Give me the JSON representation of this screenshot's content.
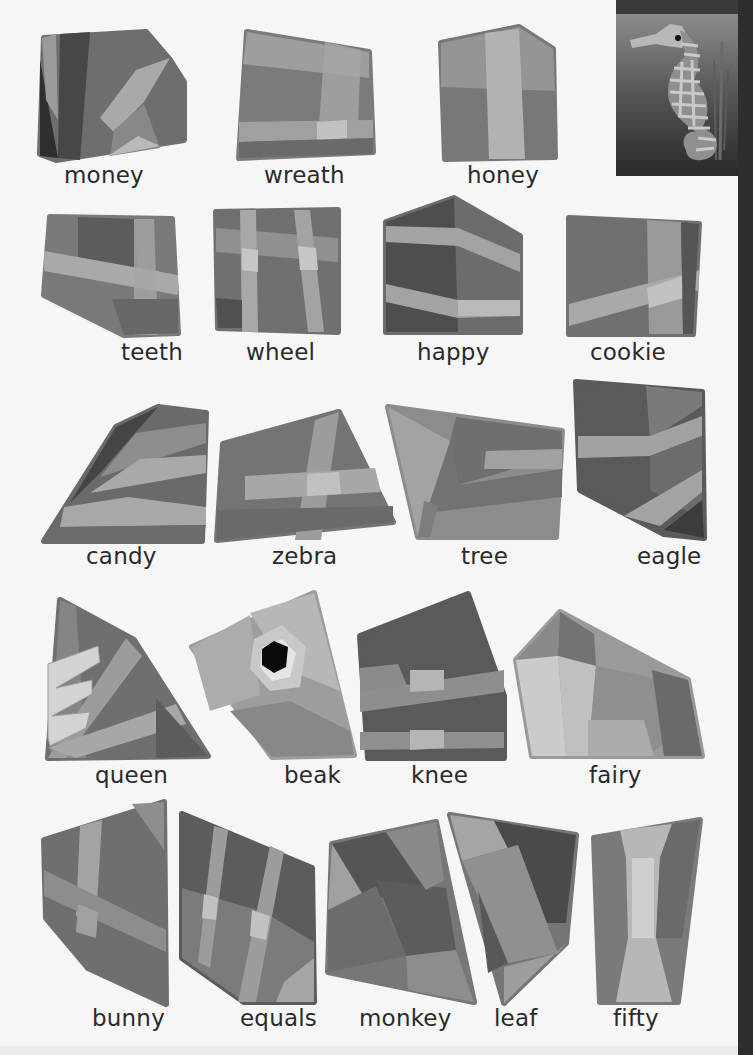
{
  "worksheet": {
    "reference_image": {
      "subject": "seahorse",
      "description": "low-poly seahorse with seaweed, reference picture"
    },
    "rows": [
      {
        "pieces": [
          {
            "word": "money"
          },
          {
            "word": "wreath"
          },
          {
            "word": "honey"
          }
        ]
      },
      {
        "pieces": [
          {
            "word": "teeth"
          },
          {
            "word": "wheel"
          },
          {
            "word": "happy"
          },
          {
            "word": "cookie"
          }
        ]
      },
      {
        "pieces": [
          {
            "word": "candy"
          },
          {
            "word": "zebra"
          },
          {
            "word": "tree"
          },
          {
            "word": "eagle"
          }
        ]
      },
      {
        "pieces": [
          {
            "word": "queen"
          },
          {
            "word": "beak"
          },
          {
            "word": "knee"
          },
          {
            "word": "fairy"
          }
        ]
      },
      {
        "pieces": [
          {
            "word": "bunny"
          },
          {
            "word": "equals"
          },
          {
            "word": "monkey"
          },
          {
            "word": "leaf"
          },
          {
            "word": "fifty"
          }
        ]
      }
    ]
  },
  "colors": {
    "paper": "#f6f6f6",
    "text": "#2a2a2a",
    "piece_dark": "#4a4a4a",
    "piece_mid": "#707070",
    "piece_light": "#a8a8a8",
    "edge_strip": "#2e2e2e"
  }
}
